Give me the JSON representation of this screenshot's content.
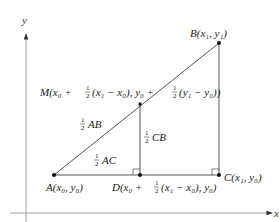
{
  "diagram": {
    "axes": {
      "x_label": "x",
      "y_label": "y"
    },
    "points": {
      "A": {
        "name": "A",
        "coords": "(x₀, y₀)"
      },
      "B": {
        "name": "B",
        "coords": "(x₁, y₁)"
      },
      "C": {
        "name": "C",
        "coords": "(x₁, y₀)"
      },
      "D": {
        "name": "D",
        "coords_pre": "(x₀ + ",
        "frac": "1/2",
        "coords_post": "(x₁ − x₀), y₀)"
      },
      "M": {
        "name": "M",
        "part1": "(x₀ + ",
        "part2": "(x₁ − x₀), y₀ + ",
        "part3": "(y₁ − y₀))"
      }
    },
    "segment_labels": {
      "half_AB": "AB",
      "half_AC": "AC",
      "half_CB": "CB"
    },
    "fraction": {
      "num": "1",
      "den": "2"
    },
    "colors": {
      "line": "#444444",
      "axis": "#888888",
      "point": "#111111"
    }
  }
}
